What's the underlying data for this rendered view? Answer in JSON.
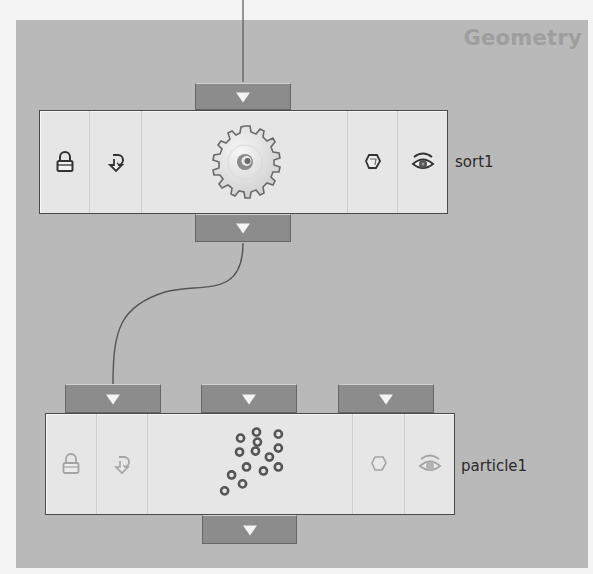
{
  "network": {
    "context_label": "Geometry",
    "background_color": "#b9b9b9"
  },
  "nodes": [
    {
      "name": "sort1",
      "type_icon": "gear-icon",
      "flags": [
        "lock-icon",
        "bypass-icon",
        "template-icon",
        "display-icon"
      ],
      "state": "active",
      "inputs": 1,
      "outputs": 1
    },
    {
      "name": "particle1",
      "type_icon": "particles-icon",
      "flags": [
        "lock-icon",
        "bypass-icon",
        "template-icon",
        "display-icon"
      ],
      "state": "inactive",
      "inputs": 3,
      "outputs": 1
    }
  ],
  "connections": [
    {
      "from": "sort1.output0",
      "to": "particle1.input0"
    }
  ]
}
